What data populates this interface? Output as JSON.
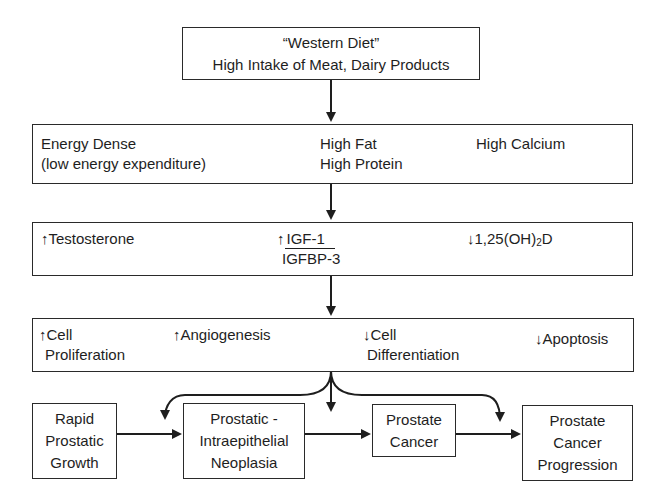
{
  "diagram": {
    "type": "flowchart",
    "stages": [
      {
        "id": "western-diet",
        "lines": [
          "“Western Diet”",
          "High Intake of Meat, Dairy Products"
        ]
      },
      {
        "id": "diet-characteristics",
        "items": [
          {
            "lines": [
              "Energy Dense",
              "(low energy expenditure)"
            ]
          },
          {
            "lines": [
              "High Fat",
              "High Protein"
            ]
          },
          {
            "lines": [
              "High Calcium"
            ]
          }
        ]
      },
      {
        "id": "hormonal-effects",
        "items": [
          {
            "arrow": "↑",
            "label": "Testosterone"
          },
          {
            "arrow": "↑",
            "numerator": "IGF-1",
            "denominator": "IGFBP-3"
          },
          {
            "arrow": "↓",
            "label_pre": "1,25(OH)",
            "label_sub": "2",
            "label_post": "D"
          }
        ]
      },
      {
        "id": "cellular-effects",
        "items": [
          {
            "arrow": "↑",
            "line1": "Cell",
            "line2": "Proliferation"
          },
          {
            "arrow": "↑",
            "line1": "Angiogenesis"
          },
          {
            "arrow": "↓",
            "line1": "Cell",
            "line2": "Differentiation"
          },
          {
            "arrow": "↓",
            "line1": "Apoptosis"
          }
        ]
      }
    ],
    "progression": [
      {
        "id": "rapid-growth",
        "lines": [
          "Rapid",
          "Prostatic",
          "Growth"
        ]
      },
      {
        "id": "pin",
        "lines": [
          "Prostatic -",
          "Intraepithelial",
          "Neoplasia"
        ]
      },
      {
        "id": "cancer",
        "lines": [
          "Prostate",
          "Cancer"
        ]
      },
      {
        "id": "progression",
        "lines": [
          "Prostate",
          "Cancer",
          "Progression"
        ]
      }
    ],
    "colors": {
      "line": "#1e1e1e",
      "background": "#ffffff"
    }
  }
}
